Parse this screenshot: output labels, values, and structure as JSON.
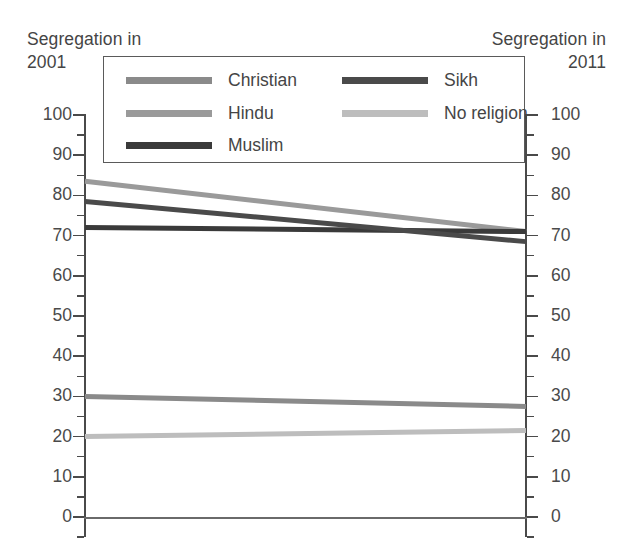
{
  "headers": {
    "left": "Segregation in\n2001",
    "right": "Segregation in\n2011"
  },
  "axis": {
    "ticks": [
      "100",
      "90",
      "80",
      "70",
      "60",
      "50",
      "40",
      "30",
      "20",
      "10",
      "0"
    ]
  },
  "legend": {
    "items": [
      {
        "label": "Christian",
        "color": "#8a8a8a"
      },
      {
        "label": "Hindu",
        "color": "#9a9a9a"
      },
      {
        "label": "Muslim",
        "color": "#3a3a3a"
      },
      {
        "label": "Sikh",
        "color": "#4a4a4a"
      },
      {
        "label": "No religion",
        "color": "#bdbdbd"
      }
    ]
  },
  "chart_data": {
    "type": "line",
    "title": "",
    "subtitle": "",
    "xlabel": "",
    "ylabel": "",
    "x": [
      "2001",
      "2011"
    ],
    "xlabels": [
      "Segregation in 2001",
      "Segregation in 2011"
    ],
    "ylim": [
      0,
      100
    ],
    "yticks": [
      0,
      10,
      20,
      30,
      40,
      50,
      60,
      70,
      80,
      90,
      100
    ],
    "yminor_step": 5,
    "grid": false,
    "dual_axis": true,
    "legend_position": "top-inside",
    "series": [
      {
        "name": "Christian",
        "values": [
          30.0,
          27.5
        ],
        "color": "#8a8a8a",
        "width": 5
      },
      {
        "name": "Hindu",
        "values": [
          83.5,
          71.0
        ],
        "color": "#9a9a9a",
        "width": 5
      },
      {
        "name": "Muslim",
        "values": [
          72.0,
          71.0
        ],
        "color": "#3a3a3a",
        "width": 5
      },
      {
        "name": "Sikh",
        "values": [
          78.5,
          68.5
        ],
        "color": "#4a4a4a",
        "width": 5
      },
      {
        "name": "No religion",
        "values": [
          20.0,
          21.5
        ],
        "color": "#bdbdbd",
        "width": 5
      }
    ]
  }
}
